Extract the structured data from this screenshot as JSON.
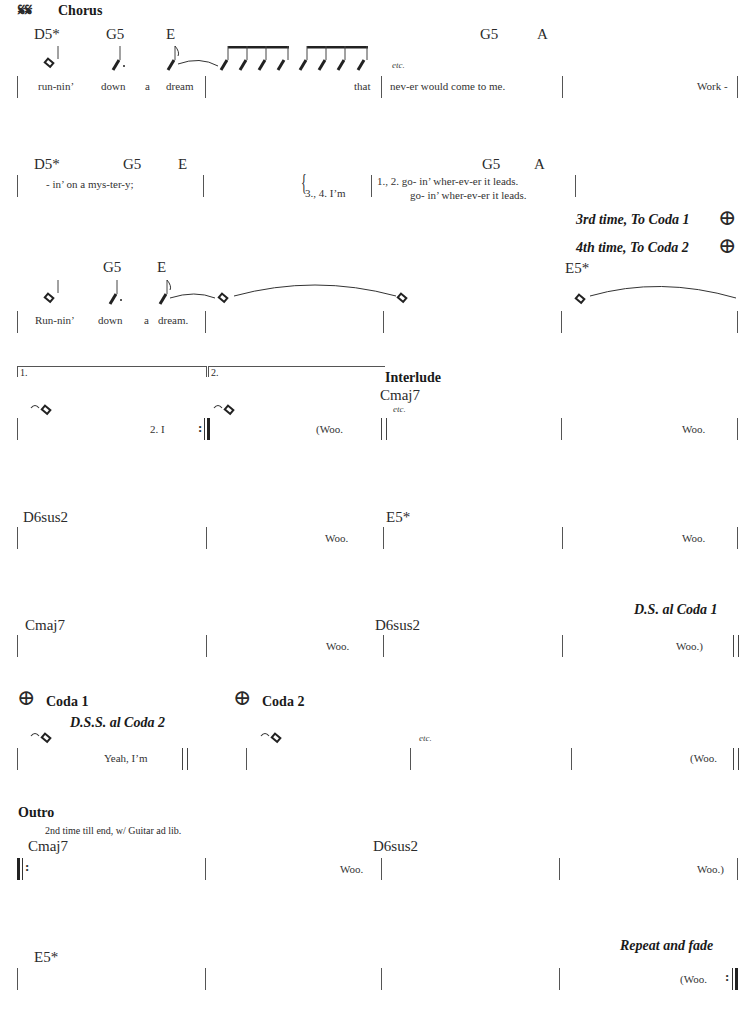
{
  "page": {
    "segno": "𝄋𝄋",
    "rows": [
      {
        "section": "Chorus",
        "chords": [
          "D5*",
          "G5",
          "E",
          "G5",
          "A"
        ],
        "etc": "etc.",
        "lyrics": [
          "run-nin’",
          "down",
          "a",
          "dream",
          "that",
          "nev-er would come to me.",
          "Work -"
        ]
      },
      {
        "chords": [
          "D5*",
          "G5",
          "E",
          "G5",
          "A"
        ],
        "lyrics": [
          "- in’ on a mys-ter-y;"
        ],
        "verse_choice": {
          "left": "3., 4. I’m",
          "line1": "1., 2. go- in’ wher-ev-er it leads.",
          "line2": "go- in’ wher-ev-er it leads."
        },
        "directions": [
          "3rd time, To Coda 1",
          "4th time, To Coda 2"
        ]
      },
      {
        "chords": [
          "G5",
          "E",
          "E5*"
        ],
        "lyrics": [
          "Run-nin’",
          "down",
          "a",
          "dream."
        ]
      },
      {
        "endings": [
          "1.",
          "2."
        ],
        "section": "Interlude",
        "chords": [
          "Cmaj7"
        ],
        "etc": "etc.",
        "lyrics": [
          "2. I",
          "(Woo.",
          "Woo."
        ]
      },
      {
        "chords": [
          "D6sus2",
          "E5*"
        ],
        "lyrics": [
          "Woo.",
          "Woo."
        ]
      },
      {
        "direction": "D.S. al Coda 1",
        "chords": [
          "Cmaj7",
          "D6sus2"
        ],
        "lyrics": [
          "Woo.",
          "Woo.)"
        ]
      },
      {
        "coda1": "Coda 1",
        "coda2": "Coda 2",
        "direction": "D.S.S. al Coda 2",
        "etc": "etc.",
        "lyrics": [
          "Yeah, I’m",
          "(Woo."
        ]
      },
      {
        "section": "Outro",
        "note": "2nd time till end, w/ Guitar ad lib.",
        "chords": [
          "Cmaj7",
          "D6sus2"
        ],
        "lyrics": [
          "Woo.",
          "Woo.)"
        ]
      },
      {
        "direction": "Repeat and fade",
        "chords": [
          "E5*"
        ],
        "lyrics": [
          "(Woo."
        ]
      }
    ],
    "coda_symbol": "⊕"
  }
}
